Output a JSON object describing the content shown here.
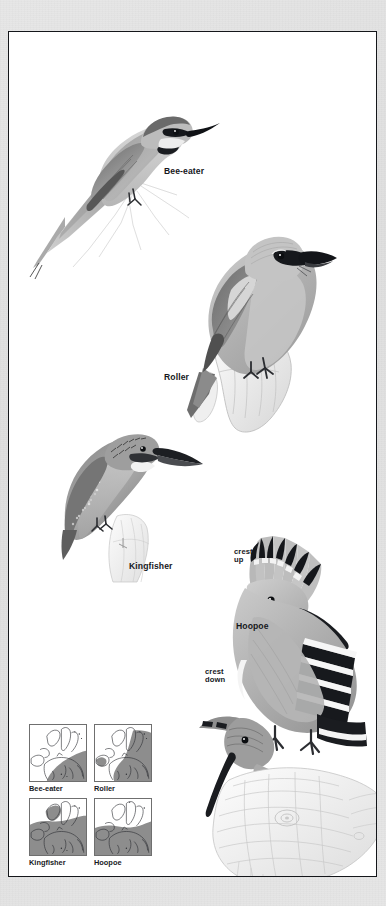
{
  "page": {
    "type": "field-guide-plate",
    "background_color": "#e3e3e3",
    "paper_color": "#ffffff",
    "border_color": "#14161a"
  },
  "plate": {
    "birds": [
      {
        "id": "bee-eater",
        "label": "Bee-eater"
      },
      {
        "id": "roller",
        "label": "Roller"
      },
      {
        "id": "kingfisher",
        "label": "Kingfisher"
      },
      {
        "id": "hoopoe",
        "label": "Hoopoe"
      }
    ],
    "annotations": {
      "crest_up": "crest\nup",
      "crest_down": "crest\ndown"
    }
  },
  "maps": {
    "legend_land_color": "#f3f3f1",
    "legend_range_color": "#8d8d8d",
    "sea_color": "#ffffff",
    "items": [
      {
        "id": "map-bee-eater",
        "caption": "Bee-eater"
      },
      {
        "id": "map-roller",
        "caption": "Roller"
      },
      {
        "id": "map-kingfisher",
        "caption": "Kingfisher"
      },
      {
        "id": "map-hoopoe",
        "caption": "Hoopoe"
      }
    ]
  }
}
